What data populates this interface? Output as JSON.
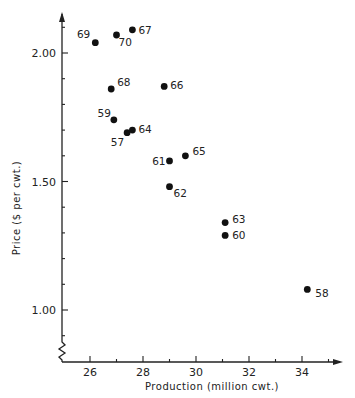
{
  "chart_data": {
    "type": "scatter",
    "title": "",
    "xlabel": "Production (million cwt.)",
    "ylabel": "Price ($ per cwt.)",
    "xlim": [
      25,
      35.5
    ],
    "ylim": [
      0.82,
      2.25
    ],
    "x_ticks": [
      26,
      28,
      30,
      32,
      34
    ],
    "x_tick_labels": [
      "26",
      "28",
      "30",
      "32",
      "34"
    ],
    "y_ticks": [
      1.0,
      1.5,
      2.0
    ],
    "y_tick_labels": [
      "1.00",
      "1.50",
      "2.00"
    ],
    "grid": false,
    "legend": null,
    "axis_break_on_y": true,
    "points": [
      {
        "label": "69",
        "x": 26.2,
        "y": 2.04
      },
      {
        "label": "70",
        "x": 27.0,
        "y": 2.07
      },
      {
        "label": "67",
        "x": 27.6,
        "y": 2.09
      },
      {
        "label": "68",
        "x": 26.8,
        "y": 1.86
      },
      {
        "label": "66",
        "x": 28.8,
        "y": 1.87
      },
      {
        "label": "59",
        "x": 26.9,
        "y": 1.74
      },
      {
        "label": "57",
        "x": 27.4,
        "y": 1.69
      },
      {
        "label": "64",
        "x": 27.6,
        "y": 1.7
      },
      {
        "label": "61",
        "x": 29.0,
        "y": 1.58
      },
      {
        "label": "65",
        "x": 29.6,
        "y": 1.6
      },
      {
        "label": "62",
        "x": 29.0,
        "y": 1.48
      },
      {
        "label": "63",
        "x": 31.1,
        "y": 1.34
      },
      {
        "label": "60",
        "x": 31.1,
        "y": 1.29
      },
      {
        "label": "58",
        "x": 34.2,
        "y": 1.08
      }
    ]
  },
  "labels": {
    "xlabel": "Production (million cwt.)",
    "ylabel": "Price ($ per cwt.)"
  }
}
